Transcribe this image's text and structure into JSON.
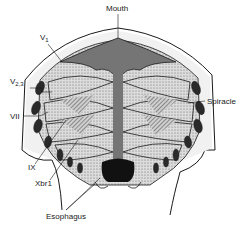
{
  "diagram": {
    "labels": {
      "mouth": "Mouth",
      "v1_main": "V",
      "v1_sub": "1",
      "v23_main": "V",
      "v23_sub": "2,3",
      "vii": "VII",
      "spiracle": "Spiracle",
      "ix": "IX",
      "xbr1": "Xbr1",
      "esophagus": "Esophagus"
    },
    "colors": {
      "ink": "#1a1a1a",
      "stipple": "#8a8a8a",
      "light_fill": "#e6e6e6",
      "background": "#ffffff"
    }
  }
}
